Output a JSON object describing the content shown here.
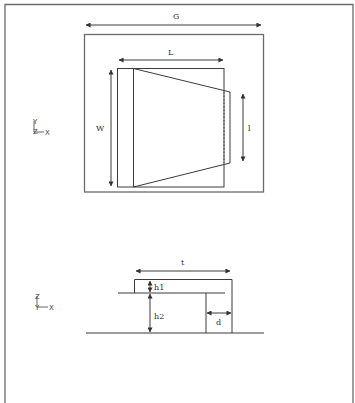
{
  "figure": {
    "type": "engineering dimension drawing",
    "frame_color": "#6b6b6b",
    "line_color": "#3a3a3a"
  },
  "top_view": {
    "axis_indicator": {
      "vertical": "Y",
      "out_of_plane": "Z",
      "horizontal": "X"
    },
    "dimensions": {
      "ground_width": "G",
      "length": "L",
      "width": "W",
      "tip_length": "l"
    }
  },
  "side_view": {
    "axis_indicator": {
      "vertical": "Z",
      "out_of_plane": "Y",
      "horizontal": "X"
    },
    "dimensions": {
      "thickness_span": "t",
      "height_1": "h1",
      "height_2": "h2",
      "depth": "d"
    }
  }
}
